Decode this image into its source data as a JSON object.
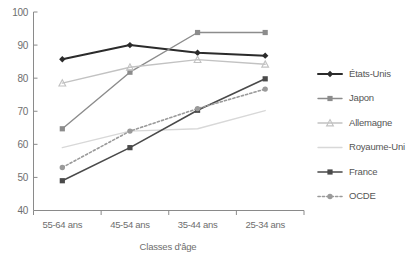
{
  "chart_data": {
    "type": "line",
    "title": "",
    "subtitle": "",
    "xlabel": "Classes d'âge",
    "ylabel": "",
    "categories": [
      "55-64 ans",
      "45-54 ans",
      "35-44 ans",
      "25-34 ans"
    ],
    "ylim": [
      40,
      100
    ],
    "yticks": [
      40,
      50,
      60,
      70,
      80,
      90,
      100
    ],
    "grid": false,
    "legend_position": "right",
    "series": [
      {
        "name": "États-Unis",
        "values": [
          85.7,
          90.0,
          87.7,
          86.8
        ],
        "color": "#2b2b2b",
        "marker": "diamond",
        "dash": "solid",
        "width": 2.0
      },
      {
        "name": "Japon",
        "values": [
          64.7,
          81.8,
          93.8,
          93.8
        ],
        "color": "#8c8c8c",
        "marker": "square",
        "dash": "solid",
        "width": 1.4
      },
      {
        "name": "Allemagne",
        "values": [
          78.5,
          83.3,
          85.6,
          84.2
        ],
        "color": "#c2c2c2",
        "marker": "triangle",
        "dash": "solid",
        "width": 1.4
      },
      {
        "name": "Royaume-Uni",
        "values": [
          59.0,
          64.0,
          64.7,
          70.2
        ],
        "color": "#d8d8d8",
        "marker": "none",
        "dash": "solid",
        "width": 1.4
      },
      {
        "name": "France",
        "values": [
          49.0,
          59.0,
          70.3,
          79.8
        ],
        "color": "#4a4a4a",
        "marker": "square",
        "dash": "solid",
        "width": 1.6
      },
      {
        "name": "OCDE",
        "values": [
          53.0,
          64.0,
          70.8,
          76.7
        ],
        "color": "#9a9a9a",
        "marker": "circle",
        "dash": "dotted",
        "width": 1.6
      }
    ]
  },
  "axes": {
    "y_tick_labels": [
      "100",
      "90",
      "80",
      "70",
      "60",
      "50",
      "40"
    ],
    "x_tick_labels": [
      "55-64 ans",
      "45-54 ans",
      "35-44 ans",
      "25-34 ans"
    ],
    "x_axis_title": "Classes d'âge"
  },
  "legend": {
    "items": [
      {
        "label": "États-Unis"
      },
      {
        "label": "Japon"
      },
      {
        "label": "Allemagne"
      },
      {
        "label": "Royaume-Uni"
      },
      {
        "label": "France"
      },
      {
        "label": "OCDE"
      }
    ]
  },
  "colors": {
    "axis": "#8a8a8a",
    "tick_text": "#6e6e6e",
    "legend_text": "#555555",
    "background": "#ffffff"
  }
}
